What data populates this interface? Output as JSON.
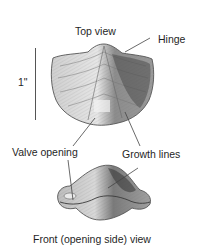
{
  "diagram": {
    "labels": {
      "top_view": "Top view",
      "hinge": "Hinge",
      "scale": "1\"",
      "valve_opening": "Valve opening",
      "growth_lines": "Growth lines",
      "front_view_caption": "Front (opening side) view"
    },
    "views": [
      {
        "name": "top-view",
        "label": "Top view"
      },
      {
        "name": "front-view",
        "label": "Front (opening side) view"
      }
    ],
    "scale_bar": {
      "length_label": "1\"",
      "orientation": "vertical"
    },
    "colors": {
      "ink": "#1f1f1f",
      "shell_light": "#d9d9d9",
      "shell_mid": "#a8a8a8",
      "shell_dark": "#555555",
      "background": "#ffffff"
    }
  }
}
